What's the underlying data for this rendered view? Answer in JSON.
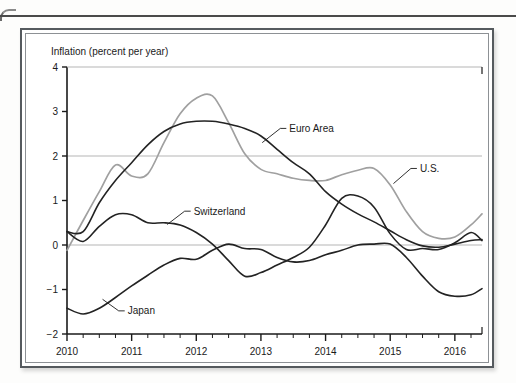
{
  "figure": {
    "axis_title": "Inflation (percent per year)",
    "colors": {
      "us_line": "#a0a0a0",
      "dark_line": "#232323",
      "gridline": "#b5b5b5",
      "axis": "#1a1a1a",
      "frame": "#555a5e",
      "page_rule": "#4a4a4a"
    }
  },
  "chart_data": {
    "type": "line",
    "title": "",
    "subtitle": "",
    "xlabel": "",
    "ylabel": "Inflation (percent per year)",
    "xlim": [
      2010.0,
      2016.42
    ],
    "ylim": [
      -2,
      4
    ],
    "yticks": [
      4,
      3,
      2,
      1,
      0,
      -1,
      -2
    ],
    "ytick_labels": [
      "4",
      "3",
      "2",
      "1",
      "0",
      "−1",
      "−2"
    ],
    "xticks": [
      2010,
      2011,
      2012,
      2013,
      2014,
      2015,
      2016
    ],
    "xtick_labels": [
      "2010",
      "2011",
      "2012",
      "2013",
      "2014",
      "2015",
      "2016"
    ],
    "minor_xtick_interval": 0.25,
    "gridlines_y": [
      2,
      0
    ],
    "grid": "horizontal-at-2-and-0",
    "legend": "inline-annotations",
    "annotations": [
      {
        "text": "Euro Area",
        "series": "Euro Area",
        "x": 2013.3,
        "y": 2.62
      },
      {
        "text": "U.S.",
        "series": "U.S.",
        "x": 2015.35,
        "y": 1.72
      },
      {
        "text": "Switzerland",
        "series": "Switzerland",
        "x": 2011.82,
        "y": 0.74
      },
      {
        "text": "Japan",
        "series": "Japan",
        "x": 2010.78,
        "y": -1.46
      }
    ],
    "x": [
      2010.0,
      2010.25,
      2010.5,
      2010.75,
      2011.0,
      2011.25,
      2011.5,
      2011.75,
      2012.0,
      2012.25,
      2012.5,
      2012.75,
      2013.0,
      2013.25,
      2013.5,
      2013.75,
      2014.0,
      2014.25,
      2014.5,
      2014.75,
      2015.0,
      2015.25,
      2015.5,
      2015.75,
      2016.0,
      2016.25,
      2016.42
    ],
    "series": [
      {
        "name": "U.S.",
        "color": "#a0a0a0",
        "values": [
          -0.12,
          0.55,
          1.2,
          1.8,
          1.55,
          1.6,
          2.3,
          2.95,
          3.3,
          3.35,
          2.75,
          2.05,
          1.7,
          1.6,
          1.5,
          1.45,
          1.45,
          1.58,
          1.68,
          1.72,
          1.35,
          0.75,
          0.3,
          0.15,
          0.18,
          0.45,
          0.7
        ]
      },
      {
        "name": "Euro Area",
        "color": "#232323",
        "values": [
          0.3,
          0.3,
          0.95,
          1.45,
          1.85,
          2.25,
          2.55,
          2.72,
          2.78,
          2.78,
          2.72,
          2.62,
          2.45,
          2.15,
          1.85,
          1.6,
          1.2,
          0.92,
          0.7,
          0.52,
          0.32,
          0.12,
          -0.02,
          -0.05,
          0.02,
          0.1,
          0.12
        ]
      },
      {
        "name": "Switzerland",
        "color": "#232323",
        "values": [
          0.3,
          0.08,
          0.42,
          0.68,
          0.68,
          0.5,
          0.5,
          0.45,
          0.28,
          0.02,
          -0.35,
          -0.7,
          -0.62,
          -0.45,
          -0.28,
          -0.05,
          0.45,
          1.05,
          1.1,
          0.85,
          0.25,
          -0.1,
          -0.08,
          -0.1,
          0.05,
          0.28,
          0.1
        ]
      },
      {
        "name": "Japan",
        "color": "#232323",
        "values": [
          -1.42,
          -1.55,
          -1.42,
          -1.18,
          -0.92,
          -0.68,
          -0.45,
          -0.3,
          -0.32,
          -0.12,
          0.02,
          -0.08,
          -0.1,
          -0.28,
          -0.38,
          -0.35,
          -0.22,
          -0.12,
          0.0,
          0.02,
          0.02,
          -0.28,
          -0.7,
          -1.05,
          -1.15,
          -1.12,
          -0.98
        ]
      }
    ]
  }
}
